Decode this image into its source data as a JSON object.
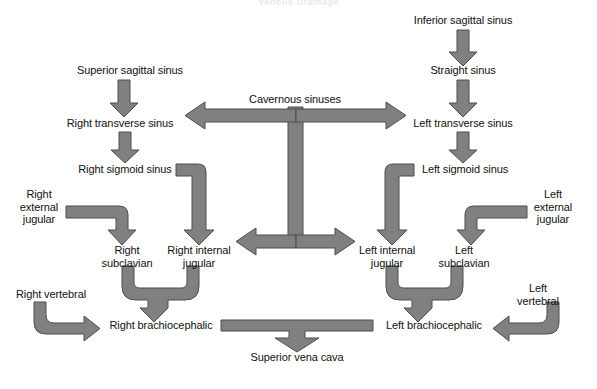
{
  "title": "Venous Drainage",
  "colors": {
    "arrow_fill": "#808080",
    "arrow_stroke": "#4d4d4d",
    "background": "#ffffff",
    "text": "#111111"
  },
  "nodes": [
    {
      "id": "superior_sagittal_sinus",
      "label": "Superior sagittal sinus",
      "x": 130,
      "y": 70
    },
    {
      "id": "inferior_sagittal_sinus",
      "label": "Inferior sagittal sinus",
      "x": 463,
      "y": 20
    },
    {
      "id": "straight_sinus",
      "label": "Straight sinus",
      "x": 463,
      "y": 70
    },
    {
      "id": "cavernous_sinuses",
      "label": "Cavernous sinuses",
      "x": 295,
      "y": 99
    },
    {
      "id": "right_transverse_sinus",
      "label": "Right transverse sinus",
      "x": 120,
      "y": 123
    },
    {
      "id": "left_transverse_sinus",
      "label": "Left transverse sinus",
      "x": 463,
      "y": 123
    },
    {
      "id": "right_sigmoid_sinus",
      "label": "Right sigmoid sinus",
      "x": 125,
      "y": 169
    },
    {
      "id": "left_sigmoid_sinus",
      "label": "Left sigmoid sinus",
      "x": 465,
      "y": 169
    },
    {
      "id": "right_external_jugular",
      "label": "Right\nexternal\njugular",
      "x": 39,
      "y": 207
    },
    {
      "id": "left_external_jugular",
      "label": "Left\nexternal\njugular",
      "x": 553,
      "y": 207
    },
    {
      "id": "right_subclavian",
      "label": "Right\nsubclavian",
      "x": 127,
      "y": 256
    },
    {
      "id": "right_internal_jugular",
      "label": "Right internal\njugular",
      "x": 199,
      "y": 256
    },
    {
      "id": "left_internal_jugular",
      "label": "Left internal\njugular",
      "x": 387,
      "y": 256
    },
    {
      "id": "left_subclavian",
      "label": "Left\nsubclavian",
      "x": 464,
      "y": 256
    },
    {
      "id": "right_vertebral",
      "label": "Right vertebral",
      "x": 51,
      "y": 294
    },
    {
      "id": "left_vertebral",
      "label": "Left vertebral",
      "x": 538,
      "y": 294
    },
    {
      "id": "right_brachiocephalic",
      "label": "Right brachiocephalic",
      "x": 161,
      "y": 325
    },
    {
      "id": "left_brachiocephalic",
      "label": "Left brachiocephalic",
      "x": 434,
      "y": 325
    },
    {
      "id": "superior_vena_cava",
      "label": "Superior vena cava",
      "x": 297,
      "y": 357
    }
  ],
  "connectors": [
    {
      "id": "ssg-to-rts",
      "from": "superior_sagittal_sinus",
      "to": "right_transverse_sinus",
      "kind": "arrow-down"
    },
    {
      "id": "isg-to-ss",
      "from": "inferior_sagittal_sinus",
      "to": "straight_sinus",
      "kind": "arrow-down"
    },
    {
      "id": "ss-to-lts",
      "from": "straight_sinus",
      "to": "left_transverse_sinus",
      "kind": "arrow-down"
    },
    {
      "id": "rts-to-rsg",
      "from": "right_transverse_sinus",
      "to": "right_sigmoid_sinus",
      "kind": "arrow-down"
    },
    {
      "id": "lts-to-lsg",
      "from": "left_transverse_sinus",
      "to": "left_sigmoid_sinus",
      "kind": "arrow-down"
    },
    {
      "id": "cav-to-rts",
      "from": "cavernous_sinuses",
      "to": "right_transverse_sinus",
      "kind": "arrow-left"
    },
    {
      "id": "cav-to-lts",
      "from": "cavernous_sinuses",
      "to": "left_transverse_sinus",
      "kind": "arrow-right"
    },
    {
      "id": "cav-to-rij",
      "from": "cavernous_sinuses",
      "to": "right_internal_jugular",
      "kind": "arrow-left"
    },
    {
      "id": "cav-to-lij",
      "from": "cavernous_sinuses",
      "to": "left_internal_jugular",
      "kind": "arrow-right"
    },
    {
      "id": "rsg-to-rij",
      "from": "right_sigmoid_sinus",
      "to": "right_internal_jugular",
      "kind": "elbow-right-down"
    },
    {
      "id": "lsg-to-lij",
      "from": "left_sigmoid_sinus",
      "to": "left_internal_jugular",
      "kind": "elbow-left-down"
    },
    {
      "id": "rej-to-rsc",
      "from": "right_external_jugular",
      "to": "right_subclavian",
      "kind": "elbow-right-down"
    },
    {
      "id": "lej-to-lsc",
      "from": "left_external_jugular",
      "to": "left_subclavian",
      "kind": "elbow-left-down"
    },
    {
      "id": "rsc-rij-to-rbc",
      "from": "right_subclavian",
      "to": "right_brachiocephalic",
      "kind": "confluence-down"
    },
    {
      "id": "lij-lsc-to-lbc",
      "from": "left_internal_jugular",
      "to": "left_brachiocephalic",
      "kind": "confluence-down"
    },
    {
      "id": "rvt-to-rbc",
      "from": "right_vertebral",
      "to": "right_brachiocephalic",
      "kind": "elbow-down-right"
    },
    {
      "id": "lvt-to-lbc",
      "from": "left_vertebral",
      "to": "left_brachiocephalic",
      "kind": "elbow-down-left"
    },
    {
      "id": "bc-to-svc",
      "from": "right_brachiocephalic",
      "to": "superior_vena_cava",
      "kind": "tee-down"
    }
  ]
}
